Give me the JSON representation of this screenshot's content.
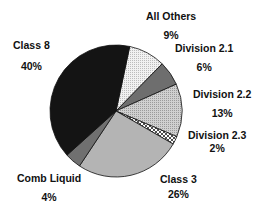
{
  "chart_data": {
    "type": "pie",
    "title": "",
    "start_angle_deg": 12,
    "direction": "clockwise",
    "categories": [
      "All Others",
      "Division 2.1",
      "Division 2.2",
      "Division 2.3",
      "Class 3",
      "Comb Liquid",
      "Class 8"
    ],
    "values": [
      9,
      6,
      13,
      2,
      26,
      4,
      40
    ],
    "labels": [
      "9%",
      "6%",
      "13%",
      "2%",
      "26%",
      "4%",
      "40%"
    ],
    "fills": [
      "#e6e6e6",
      "#6e6e6e",
      "#c4c4c4",
      "crosshatch",
      "#b4b4b4",
      "#707070",
      "#141414"
    ],
    "legend": "none (direct labels)",
    "center": [
      116,
      111
    ],
    "radius": 66
  },
  "labels": {
    "all_others": {
      "name": "All Others",
      "pct": "9%"
    },
    "division_2_1": {
      "name": "Division 2.1",
      "pct": "6%"
    },
    "division_2_2": {
      "name": "Division 2.2",
      "pct": "13%"
    },
    "division_2_3": {
      "name": "Division 2.3",
      "pct": "2%"
    },
    "class_3": {
      "name": "Class 3",
      "pct": "26%"
    },
    "comb_liquid": {
      "name": "Comb Liquid",
      "pct": "4%"
    },
    "class_8": {
      "name": "Class 8",
      "pct": "40%"
    }
  }
}
